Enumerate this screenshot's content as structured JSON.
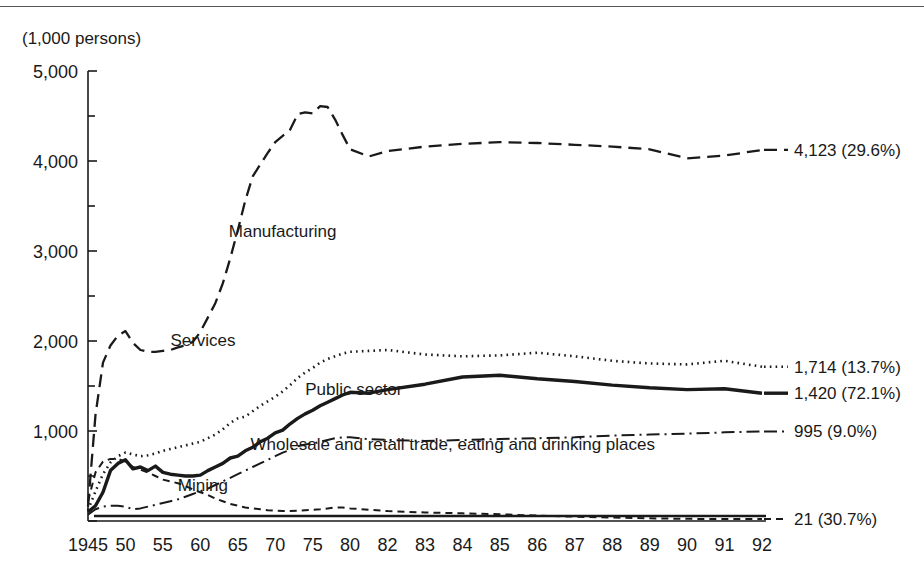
{
  "figure": {
    "unit_label": "(1,000 persons)"
  },
  "chart_data": {
    "type": "line",
    "title": "",
    "subtitle": "",
    "xlabel": "",
    "ylabel": "(1,000 persons)",
    "ylim": [
      0,
      5000
    ],
    "xlim": [
      1945,
      1992
    ],
    "grid": false,
    "legend_position": "inline-annotations",
    "y_ticks": [
      0,
      1000,
      2000,
      3000,
      4000,
      5000
    ],
    "y_tick_labels": [
      "",
      "1,000",
      "2,000",
      "3,000",
      "4,000",
      "5,000"
    ],
    "y_minor_ticks": [
      500,
      1500,
      2500,
      3500,
      4500
    ],
    "x_ticks": [
      1945,
      1950,
      1955,
      1960,
      1965,
      1970,
      1975,
      1980,
      1982,
      1983,
      1984,
      1985,
      1986,
      1987,
      1988,
      1989,
      1990,
      1991,
      1992
    ],
    "x_tick_labels": [
      "1945",
      "50",
      "55",
      "60",
      "65",
      "70",
      "75",
      "80",
      "82",
      "83",
      "84",
      "85",
      "86",
      "87",
      "88",
      "89",
      "90",
      "91",
      "92"
    ],
    "series": [
      {
        "name": "Manufacturing",
        "label": "Manufacturing",
        "end_label": "4,123 (29.6%)",
        "end_value": 4123,
        "end_share": "29.6%",
        "style": "dashed",
        "x": [
          1945,
          1946,
          1947,
          1948,
          1949,
          1950,
          1951,
          1952,
          1953,
          1954,
          1955,
          1956,
          1957,
          1958,
          1959,
          1960,
          1961,
          1962,
          1963,
          1964,
          1965,
          1966,
          1967,
          1968,
          1969,
          1970,
          1971,
          1972,
          1973,
          1974,
          1975,
          1976,
          1977,
          1978,
          1979,
          1980,
          1981,
          1982,
          1983,
          1984,
          1985,
          1986,
          1987,
          1988,
          1989,
          1990,
          1991,
          1992
        ],
        "values": [
          160,
          1180,
          1760,
          1950,
          2060,
          2110,
          1980,
          1900,
          1880,
          1880,
          1890,
          1900,
          1930,
          1950,
          1990,
          2100,
          2260,
          2420,
          2640,
          2920,
          3230,
          3560,
          3830,
          3960,
          4090,
          4210,
          4280,
          4350,
          4520,
          4540,
          4530,
          4610,
          4600,
          4460,
          4290,
          4130,
          4050,
          4110,
          4160,
          4190,
          4210,
          4200,
          4180,
          4160,
          4130,
          4030,
          4060,
          4123
        ]
      },
      {
        "name": "Services",
        "label": "Services",
        "end_label": "1,714 (13.7%)",
        "end_value": 1714,
        "end_share": "13.7%",
        "style": "dotted",
        "x": [
          1945,
          1946,
          1947,
          1948,
          1949,
          1950,
          1951,
          1952,
          1953,
          1954,
          1955,
          1956,
          1957,
          1958,
          1959,
          1960,
          1961,
          1962,
          1963,
          1964,
          1965,
          1966,
          1967,
          1968,
          1969,
          1970,
          1971,
          1972,
          1973,
          1974,
          1975,
          1976,
          1977,
          1978,
          1979,
          1980,
          1981,
          1982,
          1983,
          1984,
          1985,
          1986,
          1987,
          1988,
          1989,
          1990,
          1991,
          1992
        ],
        "values": [
          120,
          330,
          520,
          650,
          720,
          760,
          740,
          720,
          730,
          750,
          780,
          800,
          820,
          840,
          860,
          880,
          920,
          960,
          1020,
          1090,
          1140,
          1160,
          1220,
          1280,
          1330,
          1380,
          1440,
          1510,
          1590,
          1650,
          1700,
          1760,
          1800,
          1830,
          1860,
          1880,
          1890,
          1900,
          1850,
          1830,
          1840,
          1870,
          1830,
          1780,
          1750,
          1740,
          1780,
          1714
        ]
      },
      {
        "name": "Public sector",
        "label": "Public sector",
        "end_label": "1,420 (72.1%)",
        "end_value": 1420,
        "end_share": "72.1%",
        "style": "solid-thick",
        "x": [
          1945,
          1946,
          1947,
          1948,
          1949,
          1950,
          1951,
          1952,
          1953,
          1954,
          1955,
          1956,
          1957,
          1958,
          1959,
          1960,
          1961,
          1962,
          1963,
          1964,
          1965,
          1966,
          1967,
          1968,
          1969,
          1970,
          1971,
          1972,
          1973,
          1974,
          1975,
          1976,
          1977,
          1978,
          1979,
          1980,
          1981,
          1982,
          1983,
          1984,
          1985,
          1986,
          1987,
          1988,
          1989,
          1990,
          1991,
          1992
        ],
        "values": [
          100,
          170,
          320,
          560,
          640,
          680,
          580,
          600,
          560,
          610,
          540,
          520,
          510,
          500,
          500,
          510,
          560,
          600,
          640,
          700,
          720,
          780,
          820,
          880,
          920,
          980,
          1010,
          1080,
          1140,
          1190,
          1230,
          1280,
          1320,
          1360,
          1400,
          1430,
          1420,
          1460,
          1520,
          1600,
          1620,
          1580,
          1550,
          1510,
          1480,
          1460,
          1470,
          1420
        ]
      },
      {
        "name": "Wholesale and retail trade, eating and drinking places",
        "label": "Wholesale and retail trade, eating and drinking places",
        "end_label": "995 (9.0%)",
        "end_value": 995,
        "end_share": "9.0%",
        "style": "dash-dot",
        "x": [
          1945,
          1946,
          1947,
          1948,
          1949,
          1950,
          1951,
          1952,
          1953,
          1954,
          1955,
          1956,
          1957,
          1958,
          1959,
          1960,
          1961,
          1962,
          1963,
          1964,
          1965,
          1966,
          1967,
          1968,
          1969,
          1970,
          1971,
          1972,
          1973,
          1974,
          1975,
          1976,
          1977,
          1978,
          1979,
          1980,
          1981,
          1982,
          1983,
          1984,
          1985,
          1986,
          1987,
          1988,
          1989,
          1990,
          1991,
          1992
        ],
        "values": [
          70,
          130,
          160,
          170,
          170,
          160,
          130,
          140,
          160,
          180,
          200,
          220,
          240,
          270,
          300,
          330,
          360,
          400,
          440,
          480,
          520,
          560,
          600,
          640,
          680,
          720,
          760,
          790,
          830,
          850,
          860,
          880,
          900,
          920,
          930,
          930,
          910,
          900,
          890,
          900,
          910,
          920,
          930,
          950,
          960,
          970,
          985,
          995
        ]
      },
      {
        "name": "Mining",
        "label": "Mining",
        "end_label": "21 (30.7%)",
        "end_value": 21,
        "end_share": "30.7%",
        "style": "short-dash",
        "x": [
          1945,
          1946,
          1947,
          1948,
          1949,
          1950,
          1951,
          1952,
          1953,
          1954,
          1955,
          1956,
          1957,
          1958,
          1959,
          1960,
          1961,
          1962,
          1963,
          1964,
          1965,
          1966,
          1967,
          1968,
          1969,
          1970,
          1971,
          1972,
          1973,
          1974,
          1975,
          1976,
          1977,
          1978,
          1979,
          1980,
          1981,
          1982,
          1983,
          1984,
          1985,
          1986,
          1987,
          1988,
          1989,
          1990,
          1991,
          1992
        ],
        "values": [
          220,
          540,
          660,
          690,
          690,
          660,
          600,
          570,
          540,
          500,
          460,
          440,
          420,
          390,
          350,
          320,
          290,
          250,
          220,
          190,
          170,
          150,
          140,
          130,
          120,
          115,
          110,
          110,
          115,
          120,
          125,
          130,
          140,
          150,
          150,
          140,
          125,
          110,
          95,
          85,
          75,
          60,
          48,
          38,
          30,
          24,
          22,
          21
        ]
      }
    ],
    "inline_annotations": [
      {
        "text": "Manufacturing",
        "x": 1963.8,
        "y": 3160
      },
      {
        "text": "Services",
        "x": 1956.0,
        "y": 1940
      },
      {
        "text": "Public sector",
        "x": 1974.0,
        "y": 1400
      },
      {
        "text": "Wholesale and retail trade, eating and drinking places",
        "x": 1966.7,
        "y": 790
      },
      {
        "text": "Mining",
        "x": 1957.0,
        "y": 330
      }
    ]
  }
}
